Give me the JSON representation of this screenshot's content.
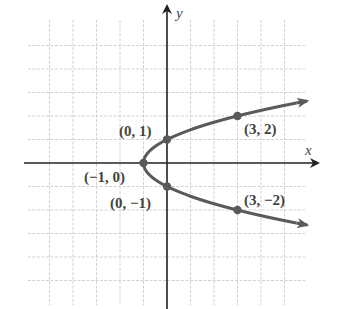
{
  "chart_data": {
    "type": "line",
    "title": "",
    "equation": "x = y^2 - 1",
    "xlabel": "x",
    "ylabel": "y",
    "xlim": [
      -6,
      6
    ],
    "ylim": [
      -6,
      6
    ],
    "grid": true,
    "points": [
      {
        "x": -1,
        "y": 0,
        "label": "(−1, 0)"
      },
      {
        "x": 0,
        "y": 1,
        "label": "(0, 1)"
      },
      {
        "x": 0,
        "y": -1,
        "label": "(0, −1)"
      },
      {
        "x": 3,
        "y": 2,
        "label": "(3, 2)"
      },
      {
        "x": 3,
        "y": -2,
        "label": "(3, −2)"
      }
    ],
    "colors": {
      "curve": "#5a5a5a",
      "axis": "#222222",
      "grid": "#cfcfcf"
    }
  },
  "labels": {
    "x_axis": "x",
    "y_axis": "y",
    "p_vertex": "(−1, 0)",
    "p_0_1": "(0, 1)",
    "p_0_m1": "(0, −1)",
    "p_3_2": "(3, 2)",
    "p_3_m2": "(3, −2)"
  }
}
